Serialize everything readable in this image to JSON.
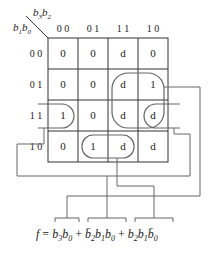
{
  "kmap": {
    "row_var": [
      "b1",
      "b0"
    ],
    "col_var": [
      "b3",
      "b2"
    ],
    "col_labels": [
      "0 0",
      "0 1",
      "1 1",
      "1 0"
    ],
    "row_labels": [
      "0 0",
      "0 1",
      "1 1",
      "1 0"
    ],
    "cells": [
      [
        "0",
        "0",
        "d",
        "0"
      ],
      [
        "0",
        "0",
        "d",
        "1"
      ],
      [
        "1",
        "0",
        "d",
        "d"
      ],
      [
        "0",
        "1",
        "d",
        "d"
      ]
    ]
  },
  "equation": {
    "lhs": "f",
    "terms": [
      "b3b0",
      "b̄2b1b0",
      "b2b1b̄0"
    ]
  }
}
